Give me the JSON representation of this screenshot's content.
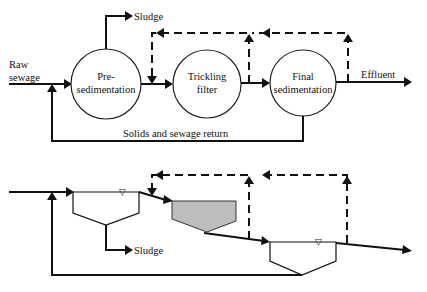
{
  "diagram": {
    "top_schematic": {
      "inlet_label_line1": "Raw",
      "inlet_label_line2": "sewage",
      "sludge_label": "Sludge",
      "units": [
        {
          "name": "presedimentation",
          "line1": "Pre-",
          "line2": "sedimentation"
        },
        {
          "name": "trickling-filter",
          "line1": "Trickling",
          "line2": "filter"
        },
        {
          "name": "final-sedimentation",
          "line1": "Final",
          "line2": "sedimentation"
        }
      ],
      "effluent_label": "Effluent",
      "return_label": "Solids and sewage return",
      "recirculation": "dashed recycle lines"
    },
    "bottom_profile": {
      "sludge_label": "Sludge",
      "water_level_symbol": "▽"
    }
  }
}
